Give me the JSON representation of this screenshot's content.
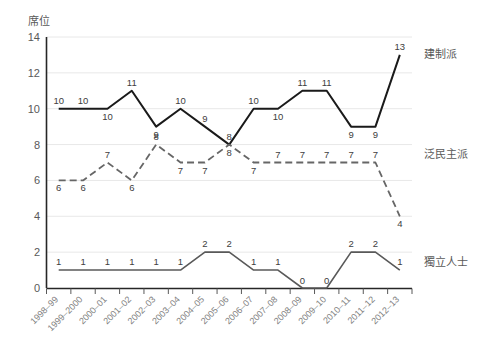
{
  "chart_data": {
    "type": "line",
    "title": "",
    "xlabel": "",
    "ylabel": "席位",
    "ylim": [
      0,
      14
    ],
    "yticks": [
      0,
      2,
      4,
      6,
      8,
      10,
      12,
      14
    ],
    "grid": true,
    "legend_position": "right-inline",
    "categories": [
      "1998–99",
      "1999–2000",
      "2000–01",
      "2001–02",
      "2002–03",
      "2003–04",
      "2004–05",
      "2005–06",
      "2006–07",
      "2007–08",
      "2008–09",
      "2009–10",
      "2010–11",
      "2011–12",
      "2012–13"
    ],
    "series": [
      {
        "name": "建制派",
        "style": "solid",
        "color": "#1a1a1a",
        "values": [
          10,
          10,
          10,
          11,
          9,
          10,
          9,
          8,
          10,
          10,
          11,
          11,
          9,
          9,
          13
        ]
      },
      {
        "name": "泛民主派",
        "style": "dashed",
        "color": "#666666",
        "values": [
          6,
          6,
          7,
          6,
          8,
          7,
          7,
          8,
          7,
          7,
          7,
          7,
          7,
          7,
          4
        ]
      },
      {
        "name": "獨立人士",
        "style": "solid",
        "color": "#595959",
        "values": [
          1,
          1,
          1,
          1,
          1,
          1,
          2,
          2,
          1,
          1,
          0,
          0,
          2,
          2,
          1
        ]
      }
    ]
  },
  "axis": {
    "y_axis_title": "席位",
    "y_tick_labels": [
      "0",
      "2",
      "4",
      "6",
      "8",
      "10",
      "12",
      "14"
    ]
  },
  "series_labels": {
    "pro_establishment": "建制派",
    "pan_democrat": "泛民主派",
    "independent": "獨立人士"
  }
}
